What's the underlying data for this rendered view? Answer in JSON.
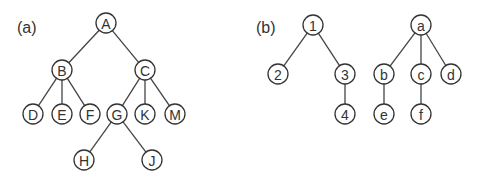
{
  "panels": [
    {
      "id": "a",
      "label": "(a)",
      "label_pos": [
        17,
        27
      ],
      "trees": [
        {
          "nodes": [
            {
              "id": "A",
              "label": "A",
              "x": 106,
              "y": 23
            },
            {
              "id": "B",
              "label": "B",
              "x": 62,
              "y": 70
            },
            {
              "id": "C",
              "label": "C",
              "x": 145,
              "y": 70
            },
            {
              "id": "D",
              "label": "D",
              "x": 33,
              "y": 114
            },
            {
              "id": "E",
              "label": "E",
              "x": 62,
              "y": 114
            },
            {
              "id": "F",
              "label": "F",
              "x": 90,
              "y": 114
            },
            {
              "id": "G",
              "label": "G",
              "x": 117,
              "y": 114
            },
            {
              "id": "K",
              "label": "K",
              "x": 145,
              "y": 114
            },
            {
              "id": "M",
              "label": "M",
              "x": 175,
              "y": 114
            },
            {
              "id": "H",
              "label": "H",
              "x": 84,
              "y": 160
            },
            {
              "id": "J",
              "label": "J",
              "x": 152,
              "y": 160
            }
          ],
          "edges": [
            [
              "A",
              "B"
            ],
            [
              "A",
              "C"
            ],
            [
              "B",
              "D"
            ],
            [
              "B",
              "E"
            ],
            [
              "B",
              "F"
            ],
            [
              "C",
              "G"
            ],
            [
              "C",
              "K"
            ],
            [
              "C",
              "M"
            ],
            [
              "G",
              "H"
            ],
            [
              "G",
              "J"
            ]
          ]
        }
      ]
    },
    {
      "id": "b",
      "label": "(b)",
      "label_pos": [
        256,
        27
      ],
      "trees": [
        {
          "nodes": [
            {
              "id": "1",
              "label": "1",
              "x": 313,
              "y": 25
            },
            {
              "id": "2",
              "label": "2",
              "x": 278,
              "y": 74
            },
            {
              "id": "3",
              "label": "3",
              "x": 345,
              "y": 74
            },
            {
              "id": "4",
              "label": "4",
              "x": 345,
              "y": 114
            }
          ],
          "edges": [
            [
              "1",
              "2"
            ],
            [
              "1",
              "3"
            ],
            [
              "3",
              "4"
            ]
          ]
        },
        {
          "nodes": [
            {
              "id": "a",
              "label": "a",
              "x": 421,
              "y": 25
            },
            {
              "id": "b",
              "label": "b",
              "x": 384,
              "y": 74
            },
            {
              "id": "c",
              "label": "c",
              "x": 421,
              "y": 74
            },
            {
              "id": "d",
              "label": "d",
              "x": 451,
              "y": 74
            },
            {
              "id": "e",
              "label": "e",
              "x": 384,
              "y": 114
            },
            {
              "id": "f",
              "label": "f",
              "x": 421,
              "y": 114
            }
          ],
          "edges": [
            [
              "a",
              "b"
            ],
            [
              "a",
              "c"
            ],
            [
              "a",
              "d"
            ],
            [
              "b",
              "e"
            ],
            [
              "c",
              "f"
            ]
          ]
        }
      ]
    }
  ],
  "style": {
    "node_radius": 10,
    "stroke_color": "#333333",
    "background": "#ffffff"
  }
}
